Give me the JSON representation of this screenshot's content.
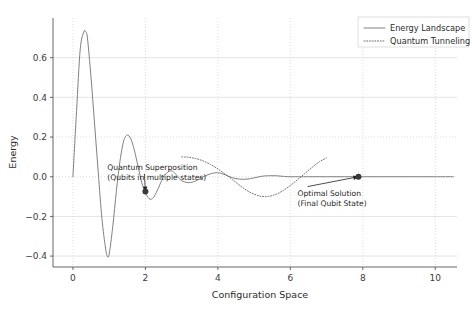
{
  "chart_data": {
    "type": "line",
    "title": "",
    "xlabel": "Configuration Space",
    "ylabel": "Energy",
    "xlim": [
      -0.55,
      10.6
    ],
    "ylim": [
      -0.455,
      0.8
    ],
    "xticks": [
      "0",
      "2",
      "4",
      "6",
      "8",
      "10"
    ],
    "xtick_values": [
      0,
      2,
      4,
      6,
      8,
      10
    ],
    "yticks": [
      "-0.4",
      "-0.2",
      "0.0",
      "0.2",
      "0.4",
      "0.6"
    ],
    "ytick_values": [
      -0.4,
      -0.2,
      0.0,
      0.2,
      0.4,
      0.6
    ],
    "grid": true,
    "legend_position": "upper right",
    "series": [
      {
        "name": "Energy Landscape",
        "style": "solid",
        "color": "#808080",
        "x": [
          0.0,
          0.1,
          0.2,
          0.3,
          0.35,
          0.4,
          0.5,
          0.6,
          0.7,
          0.8,
          0.9,
          0.95,
          1.0,
          1.1,
          1.2,
          1.3,
          1.4,
          1.5,
          1.6,
          1.7,
          1.8,
          1.9,
          2.0,
          2.1,
          2.2,
          2.3,
          2.4,
          2.5,
          2.6,
          2.7,
          2.8,
          2.9,
          3.0,
          3.2,
          3.4,
          3.6,
          3.8,
          4.0,
          4.2,
          4.4,
          4.6,
          4.8,
          5.0,
          5.2,
          5.4,
          5.6,
          5.8,
          6.0,
          6.5,
          7.0,
          7.5,
          8.0,
          8.5,
          9.0,
          9.5,
          10.0,
          10.5
        ],
        "y": [
          0.0,
          0.33,
          0.64,
          0.73,
          0.73,
          0.7,
          0.5,
          0.26,
          0.02,
          -0.21,
          -0.36,
          -0.4,
          -0.39,
          -0.25,
          -0.07,
          0.08,
          0.18,
          0.21,
          0.19,
          0.13,
          0.05,
          -0.03,
          -0.08,
          -0.11,
          -0.11,
          -0.08,
          -0.04,
          0.0,
          0.02,
          0.03,
          0.02,
          0.0,
          -0.02,
          -0.03,
          -0.02,
          0.0,
          0.015,
          0.02,
          0.01,
          -0.005,
          -0.012,
          -0.012,
          -0.006,
          0.002,
          0.005,
          0.005,
          0.002,
          0.0,
          0.0,
          0.0,
          0.0,
          0.0,
          0.0,
          0.0,
          0.0,
          0.0,
          0.0
        ]
      },
      {
        "name": "Quantum Tunneling",
        "style": "dotted",
        "color": "#6e6e6e",
        "x": [
          3.0,
          3.2,
          3.4,
          3.6,
          3.8,
          4.0,
          4.2,
          4.4,
          4.6,
          4.8,
          5.0,
          5.2,
          5.4,
          5.6,
          5.8,
          6.0,
          6.2,
          6.4,
          6.6,
          6.8,
          7.0
        ],
        "y": [
          0.1,
          0.098,
          0.091,
          0.079,
          0.061,
          0.039,
          0.013,
          -0.014,
          -0.043,
          -0.069,
          -0.088,
          -0.099,
          -0.099,
          -0.089,
          -0.07,
          -0.044,
          -0.015,
          0.016,
          0.047,
          0.075,
          0.095
        ]
      }
    ],
    "annotations": [
      {
        "id": "quantum-superposition",
        "lines": [
          "Quantum Superposition",
          "(Qubits in multiple states)"
        ],
        "point_x": 2.0,
        "point_y": -0.075,
        "text_x": 0.95,
        "text_y": 0.035
      },
      {
        "id": "optimal-solution",
        "lines": [
          "Optimal Solution",
          "(Final Qubit State)"
        ],
        "point_x": 7.88,
        "point_y": 0.0,
        "text_x": 6.2,
        "text_y": -0.095
      }
    ],
    "markers": [
      {
        "id": "superposition-marker",
        "x": 2.0,
        "y": -0.075
      },
      {
        "id": "optimal-marker",
        "x": 7.88,
        "y": 0.0
      }
    ]
  },
  "legend": {
    "items": [
      {
        "label": "Energy Landscape",
        "style": "solid"
      },
      {
        "label": "Quantum Tunneling",
        "style": "dotted"
      }
    ]
  },
  "axes": {
    "x_title": "Configuration Space",
    "y_title": "Energy"
  }
}
